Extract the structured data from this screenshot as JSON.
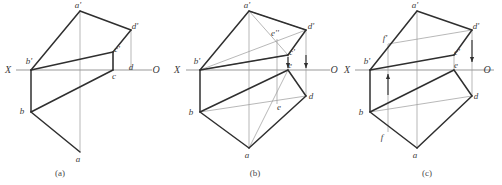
{
  "figure": {
    "type": "engineering-drawing",
    "background_color": "#ffffff",
    "edge_color": "#2f2f2f",
    "construction_color": "#9a9a9a",
    "axis_color": "#9a9a9a",
    "label_color": "#3b3b3b"
  },
  "captions": [
    {
      "id": "a",
      "text": "(a)",
      "x": 60,
      "y": 176
    },
    {
      "id": "b",
      "text": "(b)",
      "x": 255,
      "y": 176
    },
    {
      "id": "c",
      "text": "(c)",
      "x": 427,
      "y": 176
    }
  ],
  "panels": [
    {
      "id": "a",
      "caption": "(a)",
      "axis": {
        "label_left": "X",
        "label_right": "O",
        "y": 70,
        "x_start": 16,
        "x_end": 152
      },
      "axis_label_left": {
        "text": "X",
        "x": 8,
        "y": 73
      },
      "axis_label_right": {
        "text": "O",
        "x": 156,
        "y": 73
      },
      "points": [
        {
          "name": "a-prime",
          "label": "a'",
          "x": 80,
          "y": 11,
          "label_dx": -2,
          "label_dy": -3
        },
        {
          "name": "d-prime",
          "label": "d'",
          "x": 131,
          "y": 30,
          "label_dx": 4,
          "label_dy": -1
        },
        {
          "name": "c-prime",
          "label": "c'",
          "x": 113,
          "y": 52,
          "label_dx": 4,
          "label_dy": 0
        },
        {
          "name": "b-prime",
          "label": "b'",
          "x": 31,
          "y": 70,
          "label_dx": -2,
          "label_dy": -6
        },
        {
          "name": "c",
          "label": "c",
          "x": 113,
          "y": 70,
          "label_dx": 1,
          "label_dy": 9
        },
        {
          "name": "b",
          "label": "b",
          "x": 31,
          "y": 112,
          "label_dx": -9,
          "label_dy": 2
        },
        {
          "name": "a",
          "label": "a",
          "x": 80,
          "y": 152,
          "label_dx": -2,
          "label_dy": 10
        },
        {
          "name": "d",
          "label": "d",
          "x": 131,
          "y": 70,
          "label_dx": 0,
          "label_dy": 0
        }
      ],
      "solid_edges": [
        [
          31,
          70,
          80,
          11
        ],
        [
          80,
          11,
          131,
          30
        ],
        [
          131,
          30,
          113,
          52
        ],
        [
          113,
          52,
          31,
          70
        ],
        [
          31,
          70,
          31,
          112
        ],
        [
          31,
          112,
          113,
          70
        ],
        [
          113,
          70,
          113,
          52
        ],
        [
          31,
          112,
          80,
          152
        ]
      ],
      "construction_lines": [
        [
          80,
          11,
          80,
          152
        ],
        [
          131,
          30,
          131,
          70
        ],
        [
          113,
          52,
          113,
          70
        ]
      ],
      "arrows": []
    },
    {
      "id": "b",
      "caption": "(b)",
      "axis": {
        "label_left": "X",
        "label_right": "O",
        "y": 70,
        "x_start": 186,
        "x_end": 330
      },
      "axis_label_left": {
        "text": "X",
        "x": 177,
        "y": 73
      },
      "axis_label_right": {
        "text": "O",
        "x": 334,
        "y": 73
      },
      "points": [
        {
          "name": "a-prime",
          "label": "a'",
          "x": 249,
          "y": 11,
          "label_dx": -2,
          "label_dy": -3
        },
        {
          "name": "d-prime",
          "label": "d'",
          "x": 306,
          "y": 30,
          "label_dx": 5,
          "label_dy": -1
        },
        {
          "name": "e-prime-upper",
          "label": "e''",
          "x": 277,
          "y": 39,
          "label_dx": -2,
          "label_dy": -3
        },
        {
          "name": "c-prime",
          "label": "c'",
          "x": 288,
          "y": 55,
          "label_dx": 4,
          "label_dy": 0
        },
        {
          "name": "b-prime",
          "label": "b'",
          "x": 200,
          "y": 70,
          "label_dx": -3,
          "label_dy": -6
        },
        {
          "name": "e-upper",
          "label": "e",
          "x": 288,
          "y": 70,
          "label_dx": 2,
          "label_dy": -2
        },
        {
          "name": "d",
          "label": "d",
          "x": 306,
          "y": 96,
          "label_dx": 5,
          "label_dy": 3
        },
        {
          "name": "e-lower",
          "label": "e",
          "x": 277,
          "y": 104,
          "label_dx": 2,
          "label_dy": 6
        },
        {
          "name": "b",
          "label": "b",
          "x": 200,
          "y": 112,
          "label_dx": -9,
          "label_dy": 3
        },
        {
          "name": "a",
          "label": "a",
          "x": 249,
          "y": 148,
          "label_dx": -2,
          "label_dy": 10
        }
      ],
      "solid_edges": [
        [
          200,
          70,
          249,
          11
        ],
        [
          249,
          11,
          306,
          30
        ],
        [
          306,
          30,
          288,
          55
        ],
        [
          288,
          55,
          200,
          70
        ],
        [
          200,
          70,
          200,
          112
        ],
        [
          200,
          112,
          288,
          70
        ],
        [
          288,
          70,
          306,
          96
        ],
        [
          306,
          96,
          249,
          148
        ],
        [
          249,
          148,
          200,
          112
        ]
      ],
      "construction_lines": [
        [
          249,
          11,
          249,
          148
        ],
        [
          306,
          30,
          306,
          96
        ],
        [
          288,
          55,
          288,
          70
        ],
        [
          249,
          11,
          288,
          55
        ],
        [
          249,
          11,
          306,
          30
        ],
        [
          200,
          70,
          306,
          30
        ],
        [
          200,
          112,
          306,
          96
        ],
        [
          249,
          148,
          288,
          70
        ],
        [
          277,
          39,
          277,
          104
        ],
        [
          200,
          70,
          288,
          55
        ]
      ],
      "arrows": [
        {
          "name": "projection-arrow-c",
          "x": 288,
          "y1": 57,
          "y2": 68,
          "direction": "down"
        },
        {
          "name": "projection-arrow-d",
          "x": 306,
          "y1": 55,
          "y2": 68,
          "direction": "down"
        }
      ]
    },
    {
      "id": "c",
      "caption": "(c)",
      "axis": {
        "label_left": "X",
        "label_right": "O",
        "y": 70,
        "x_start": 355,
        "x_end": 494
      },
      "axis_label_left": {
        "text": "X",
        "x": 347,
        "y": 73
      },
      "axis_label_right": {
        "text": "O",
        "x": 487,
        "y": 73
      },
      "points": [
        {
          "name": "a-prime",
          "label": "a'",
          "x": 417,
          "y": 11,
          "label_dx": -2,
          "label_dy": -3
        },
        {
          "name": "d-prime",
          "label": "d'",
          "x": 472,
          "y": 30,
          "label_dx": 4,
          "label_dy": -1
        },
        {
          "name": "f-prime",
          "label": "f'",
          "x": 388,
          "y": 44,
          "label_dx": -3,
          "label_dy": -3
        },
        {
          "name": "c-prime",
          "label": "c'",
          "x": 454,
          "y": 55,
          "label_dx": 3,
          "label_dy": 0
        },
        {
          "name": "b-prime",
          "label": "b'",
          "x": 370,
          "y": 70,
          "label_dx": -3,
          "label_dy": -6
        },
        {
          "name": "e",
          "label": "e",
          "x": 454,
          "y": 70,
          "label_dx": 2,
          "label_dy": -2
        },
        {
          "name": "d",
          "label": "d",
          "x": 472,
          "y": 96,
          "label_dx": 4,
          "label_dy": 3
        },
        {
          "name": "b",
          "label": "b",
          "x": 370,
          "y": 112,
          "label_dx": -9,
          "label_dy": 3
        },
        {
          "name": "f",
          "label": "f",
          "x": 388,
          "y": 132,
          "label_dx": -6,
          "label_dy": 8
        },
        {
          "name": "a",
          "label": "a",
          "x": 417,
          "y": 148,
          "label_dx": -2,
          "label_dy": 10
        }
      ],
      "solid_edges": [
        [
          370,
          70,
          417,
          11
        ],
        [
          417,
          11,
          472,
          30
        ],
        [
          472,
          30,
          454,
          55
        ],
        [
          454,
          55,
          370,
          70
        ],
        [
          370,
          70,
          370,
          112
        ],
        [
          370,
          112,
          454,
          70
        ],
        [
          454,
          70,
          472,
          96
        ],
        [
          472,
          96,
          417,
          148
        ],
        [
          417,
          148,
          370,
          112
        ]
      ],
      "construction_lines": [
        [
          417,
          11,
          417,
          148
        ],
        [
          472,
          30,
          472,
          96
        ],
        [
          454,
          55,
          454,
          70
        ],
        [
          388,
          44,
          388,
          132
        ],
        [
          388,
          44,
          472,
          30
        ],
        [
          370,
          112,
          472,
          96
        ]
      ],
      "arrows": [
        {
          "name": "projection-arrow-d-down",
          "x": 472,
          "y1": 40,
          "y2": 62,
          "direction": "down"
        },
        {
          "name": "projection-arrow-f-up",
          "x": 388,
          "y1": 95,
          "y2": 74,
          "direction": "up"
        }
      ]
    }
  ]
}
